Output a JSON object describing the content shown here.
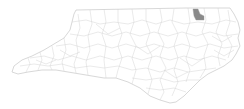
{
  "title": {
    "text": "",
    "clipped": true
  },
  "map": {
    "region": "North Carolina",
    "subdivision": "counties",
    "background_color": "#ffffff",
    "border_color": "#bdbdbd",
    "county_fill": "#ffffff",
    "highlighted_county": {
      "position": "northeast, on Virginia border",
      "fill": "#8a8a8a"
    }
  }
}
